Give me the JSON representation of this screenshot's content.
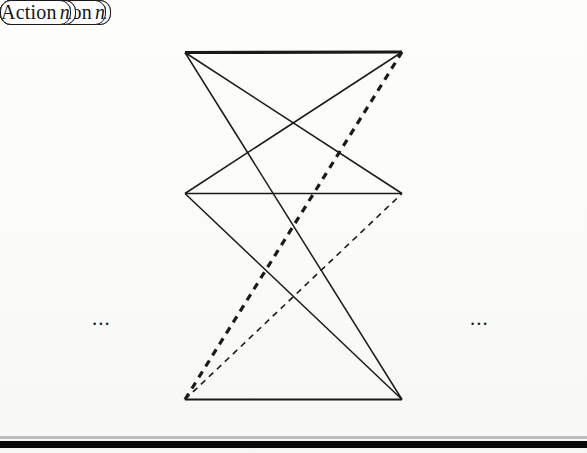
{
  "diagram": {
    "background_color": "#fdfdfb",
    "node_fill": "#ffffff",
    "node_stroke": "#1a1a1a",
    "edge_color": "#1a1a1a",
    "left_column_label": "Suggestions",
    "right_column_label": "Actions"
  },
  "nodes": {
    "left": [
      {
        "id": "suggestion-1",
        "text": "Suggestion 1",
        "italic_suffix": "",
        "x": 30,
        "y": 27,
        "w": 155,
        "h": 51
      },
      {
        "id": "suggestion-2",
        "text": "Suggestion 2",
        "italic_suffix": "",
        "x": 30,
        "y": 168,
        "w": 155,
        "h": 51
      },
      {
        "id": "suggestion-n",
        "text": "Suggestion",
        "italic_suffix": "n",
        "x": 30,
        "y": 374,
        "w": 155,
        "h": 51
      }
    ],
    "right": [
      {
        "id": "action-1",
        "text": "Action 1",
        "italic_suffix": "",
        "x": 402,
        "y": 26,
        "w": 154,
        "h": 52
      },
      {
        "id": "action-2",
        "text": "Action 2",
        "italic_suffix": "",
        "x": 402,
        "y": 168,
        "w": 154,
        "h": 51
      },
      {
        "id": "action-n",
        "text": "Action",
        "italic_suffix": "n",
        "x": 402,
        "y": 374,
        "w": 154,
        "h": 51
      }
    ]
  },
  "ellipses": {
    "left": {
      "text": "...",
      "x": 92,
      "y": 308
    },
    "right": {
      "text": "...",
      "x": 470,
      "y": 308
    }
  },
  "ports": {
    "left_x": 185,
    "right_x": 402,
    "row_y": [
      53,
      193,
      400
    ]
  },
  "edges": [
    {
      "id": "s1-a1",
      "from": "suggestion-1",
      "to": "action-1",
      "style": "solid",
      "width": 3.2,
      "dash": null
    },
    {
      "id": "s1-a2",
      "from": "suggestion-1",
      "to": "action-2",
      "style": "solid",
      "width": 1.5,
      "dash": null
    },
    {
      "id": "s1-an",
      "from": "suggestion-1",
      "to": "action-n",
      "style": "solid",
      "width": 1.5,
      "dash": null
    },
    {
      "id": "s2-a1",
      "from": "suggestion-2",
      "to": "action-1",
      "style": "solid",
      "width": 1.5,
      "dash": null
    },
    {
      "id": "s2-a2",
      "from": "suggestion-2",
      "to": "action-2",
      "style": "solid",
      "width": 1.5,
      "dash": null
    },
    {
      "id": "s2-an",
      "from": "suggestion-2",
      "to": "action-n",
      "style": "solid",
      "width": 1.5,
      "dash": null
    },
    {
      "id": "sn-a1",
      "from": "suggestion-n",
      "to": "action-1",
      "style": "dashed",
      "width": 3.2,
      "dash": "7 6"
    },
    {
      "id": "sn-a2",
      "from": "suggestion-n",
      "to": "action-2",
      "style": "dashed",
      "width": 1.6,
      "dash": "6 5"
    },
    {
      "id": "sn-an",
      "from": "suggestion-n",
      "to": "action-n",
      "style": "solid",
      "width": 1.8,
      "dash": null
    }
  ],
  "footer_bar": {
    "y": 441,
    "height": 7,
    "color": "#0a0a0a"
  },
  "footer_bar_soft": {
    "y": 436,
    "height": 3,
    "color": "#8d8d8d"
  }
}
